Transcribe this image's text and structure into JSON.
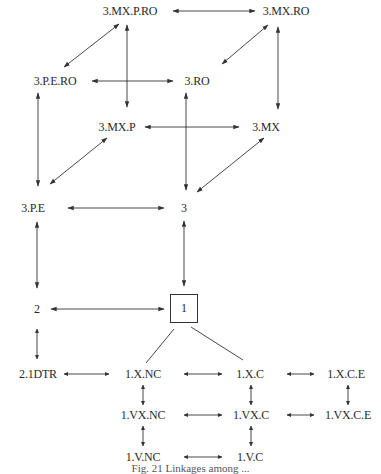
{
  "diagram": {
    "nodes": {
      "n_3mxpro": "3.MX.P.RO",
      "n_3mxro": "3.MX.RO",
      "n_3pero": "3.P.E.RO",
      "n_3ro": "3.RO",
      "n_3mxp": "3.MX.P",
      "n_3mx": "3.MX",
      "n_3pe": "3.P.E",
      "n_3": "3",
      "n_2": "2",
      "n_1": "1",
      "n_2idtr": "2.1DTR",
      "n_1xnc": "1.X.NC",
      "n_1xc": "1.X.C",
      "n_1xce": "1.X.C.E",
      "n_1vxnc": "1.VX.NC",
      "n_1vxc": "1.VX.C",
      "n_1vxce": "1.VX.C.E",
      "n_1vnc": "1.V.NC",
      "n_1vc": "1.V.C"
    },
    "edges": [
      {
        "from": "3.MX.P.RO",
        "to": "3.MX.RO",
        "type": "bidirectional"
      },
      {
        "from": "3.MX.P.RO",
        "to": "3.P.E.RO",
        "type": "bidirectional"
      },
      {
        "from": "3.MX.P.RO",
        "to": "3.MX.P",
        "type": "bidirectional"
      },
      {
        "from": "3.MX.RO",
        "to": "3.RO",
        "type": "bidirectional"
      },
      {
        "from": "3.MX.RO",
        "to": "3.MX",
        "type": "bidirectional"
      },
      {
        "from": "3.P.E.RO",
        "to": "3.RO",
        "type": "bidirectional"
      },
      {
        "from": "3.P.E.RO",
        "to": "3.P.E",
        "type": "bidirectional"
      },
      {
        "from": "3.RO",
        "to": "3",
        "type": "bidirectional"
      },
      {
        "from": "3.MX.P",
        "to": "3.MX",
        "type": "bidirectional"
      },
      {
        "from": "3.MX.P",
        "to": "3.P.E",
        "type": "bidirectional"
      },
      {
        "from": "3.MX",
        "to": "3",
        "type": "bidirectional"
      },
      {
        "from": "3.P.E",
        "to": "3",
        "type": "bidirectional"
      },
      {
        "from": "3.P.E",
        "to": "2",
        "type": "bidirectional"
      },
      {
        "from": "3",
        "to": "1",
        "type": "bidirectional"
      },
      {
        "from": "2",
        "to": "1",
        "type": "bidirectional"
      },
      {
        "from": "2",
        "to": "2.1DTR",
        "type": "bidirectional"
      },
      {
        "from": "1",
        "to": "1.X.NC",
        "type": "line"
      },
      {
        "from": "1",
        "to": "1.X.C",
        "type": "line"
      },
      {
        "from": "2.1DTR",
        "to": "1.X.NC",
        "type": "bidirectional"
      },
      {
        "from": "1.X.NC",
        "to": "1.X.C",
        "type": "bidirectional"
      },
      {
        "from": "1.X.C",
        "to": "1.X.C.E",
        "type": "bidirectional"
      },
      {
        "from": "1.X.NC",
        "to": "1.VX.NC",
        "type": "bidirectional"
      },
      {
        "from": "1.X.C",
        "to": "1.VX.C",
        "type": "bidirectional"
      },
      {
        "from": "1.X.C.E",
        "to": "1.VX.C.E",
        "type": "bidirectional"
      },
      {
        "from": "1.VX.NC",
        "to": "1.VX.C",
        "type": "bidirectional"
      },
      {
        "from": "1.VX.C",
        "to": "1.VX.C.E",
        "type": "bidirectional"
      },
      {
        "from": "1.VX.NC",
        "to": "1.V.NC",
        "type": "bidirectional"
      },
      {
        "from": "1.VX.C",
        "to": "1.V.C",
        "type": "bidirectional"
      },
      {
        "from": "1.V.NC",
        "to": "1.V.C",
        "type": "bidirectional"
      }
    ],
    "caption": "Fig. 21  Linkages among ..."
  }
}
